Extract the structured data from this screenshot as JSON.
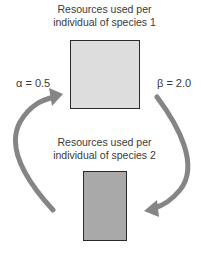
{
  "species1": {
    "label_line1": "Resources used per",
    "label_line2": "individual of species 1",
    "box_color": "#dddddd"
  },
  "species2": {
    "label_line1": "Resources used per",
    "label_line2": "individual of species 2",
    "box_color": "#a9a9a9"
  },
  "coefficients": {
    "alpha": "α = 0.5",
    "beta": "β = 2.0"
  },
  "arrow_color": "#858585"
}
